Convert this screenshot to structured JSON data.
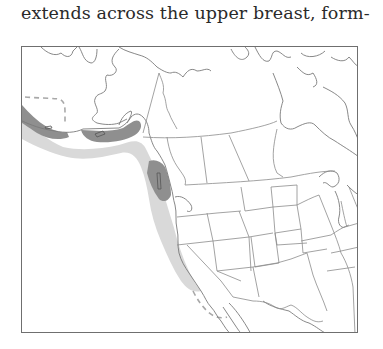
{
  "page": {
    "text_fragment": "extends across the upper breast, form-"
  },
  "map": {
    "title": "range map",
    "legend": {
      "dark_fill": "#8f8f8f",
      "light_fill": "#d9d9d9",
      "dark_meaning": "breeding / year-round range (Pacific coast)",
      "light_meaning": "nonbreeding / offshore range along Pacific coast",
      "dashed_meaning": "range limit / uncertain extent"
    },
    "regions_depicted": [
      "Alaska",
      "Canada",
      "Contiguous United States",
      "Northern Mexico",
      "Pacific coast"
    ],
    "colors": {
      "frame": "#6f6f6f",
      "coastline": "#7a7a7a",
      "borders": "#8c8c8c"
    }
  }
}
